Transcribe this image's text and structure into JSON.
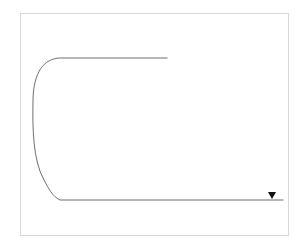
{
  "figure": {
    "canvas": {
      "width": 304,
      "height": 248
    },
    "background_color": "#ffffff"
  },
  "frame": {
    "name": "figure-border",
    "x": 20,
    "y": 13,
    "width": 268,
    "height": 222,
    "stroke_color": "#d8d8d8",
    "stroke_width": 1
  },
  "track": {
    "name": "race-track-path",
    "stroke_color": "#6e6e6e",
    "stroke_width": 1,
    "description": "Hairpin U-turn course: top straight, wide left bend, bottom straight",
    "top_straight": {
      "x1": 167,
      "y1": 58,
      "x2": 56,
      "y2": 58
    },
    "bottom_straight": {
      "x1": 56,
      "y1": 200,
      "x2": 283,
      "y2": 200
    },
    "bend": {
      "start": {
        "x": 56,
        "y": 58
      },
      "end": {
        "x": 56,
        "y": 200
      },
      "leftmost_x": 33,
      "midpoint_y": 129
    }
  },
  "finish": {
    "label": "Finish",
    "label_x": 255,
    "label_y": 183,
    "marker": {
      "name": "finish-marker-triangle",
      "x": 272,
      "y": 192,
      "width": 8,
      "height": 7,
      "fill": "#111111"
    }
  },
  "markers": {
    "filled_color": "#111111",
    "open_fill": "#ffffff",
    "open_stroke": "#333333",
    "open_stroke_width": 1,
    "ellipse_rx": 5.2,
    "ellipse_ry": 3.1,
    "clusters": [
      {
        "name": "top-cluster",
        "filled": [
          {
            "cx": 79,
            "cy": 46
          },
          {
            "cx": 94,
            "cy": 45
          },
          {
            "cx": 119,
            "cy": 46
          },
          {
            "cx": 133,
            "cy": 41
          },
          {
            "cx": 147,
            "cy": 46
          },
          {
            "cx": 161,
            "cy": 40
          }
        ],
        "open": [
          {
            "cx": 78,
            "cy": 56
          },
          {
            "cx": 98,
            "cy": 55
          },
          {
            "cx": 135,
            "cy": 55
          }
        ]
      },
      {
        "name": "bottom-cluster",
        "filled": [
          {
            "cx": 206,
            "cy": 216
          },
          {
            "cx": 219,
            "cy": 221
          },
          {
            "cx": 224,
            "cy": 212
          },
          {
            "cx": 235,
            "cy": 207
          },
          {
            "cx": 243,
            "cy": 202
          }
        ],
        "open": [
          {
            "cx": 253,
            "cy": 211
          },
          {
            "cx": 258,
            "cy": 222
          },
          {
            "cx": 272,
            "cy": 203
          }
        ]
      }
    ]
  }
}
